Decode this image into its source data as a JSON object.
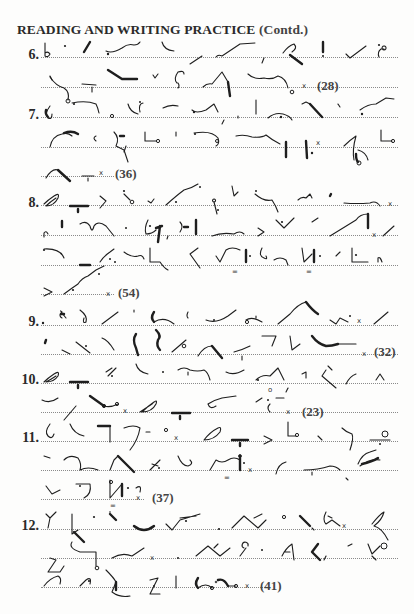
{
  "page": {
    "title_main": "READING AND WRITING PRACTICE",
    "title_suffix": "(Contd.)"
  },
  "exercises": [
    {
      "number": "6.",
      "word_count": "(28)",
      "lines": 2
    },
    {
      "number": "7.",
      "word_count": "(36)",
      "lines": 3
    },
    {
      "number": "8.",
      "word_count": "(54)",
      "lines": 4
    },
    {
      "number": "9.",
      "word_count": "(32)",
      "lines": 2
    },
    {
      "number": "10.",
      "word_count": "(23)",
      "lines": 2
    },
    {
      "number": "11.",
      "word_count": "(37)",
      "lines": 3
    },
    {
      "number": "12.",
      "word_count": "(41)",
      "lines": 3
    }
  ],
  "content_type": "shorthand outlines (Gregg-style) on dotted writing lines",
  "ink_color": "#1e1e1e",
  "rule_color": "#8a8a8a"
}
